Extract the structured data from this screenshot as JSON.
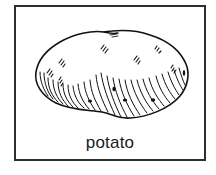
{
  "card": {
    "label": "potato",
    "border_color": "#2e2e2e",
    "background_color": "#ffffff"
  },
  "illustration": {
    "subject": "potato",
    "icon": "potato-icon",
    "style": "black line drawing with hatching"
  }
}
